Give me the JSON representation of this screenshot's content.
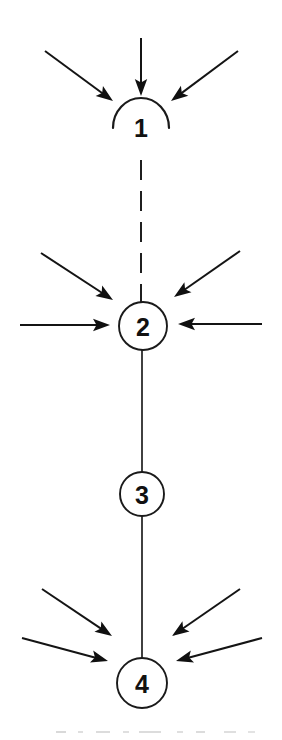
{
  "diagram": {
    "kind": "node-chain-diagram",
    "background_color": "#ffffff",
    "ink_color": "#1a1a1a",
    "canvas": {
      "width": 282,
      "height": 740
    },
    "nodes": [
      {
        "id": "node-1",
        "label": "1",
        "shape": "semicircle-open-bottom",
        "cx": 141,
        "cy": 124,
        "r": 28,
        "incoming_arrow_count": 3
      },
      {
        "id": "node-2",
        "label": "2",
        "shape": "circle",
        "cx": 143,
        "cy": 326,
        "r": 24,
        "incoming_arrow_count": 4
      },
      {
        "id": "node-3",
        "label": "3",
        "shape": "circle",
        "cx": 142,
        "cy": 494,
        "r": 22,
        "incoming_arrow_count": 0
      },
      {
        "id": "node-4",
        "label": "4",
        "shape": "circle",
        "cx": 142,
        "cy": 683,
        "r": 25,
        "incoming_arrow_count": 4
      }
    ],
    "links": [
      {
        "id": "link-1-2",
        "from": "node-1",
        "to": "node-2",
        "style": "dashed",
        "x1": 141,
        "y1": 160,
        "x2": 141,
        "y2": 302
      },
      {
        "id": "link-2-3",
        "from": "node-2",
        "to": "node-3",
        "style": "solid",
        "x1": 142,
        "y1": 350,
        "x2": 142,
        "y2": 472
      },
      {
        "id": "link-3-4",
        "from": "node-3",
        "to": "node-4",
        "style": "solid",
        "x1": 142,
        "y1": 516,
        "x2": 142,
        "y2": 658
      }
    ],
    "arrows": [
      {
        "id": "arrow-n1-left",
        "target": "node-1",
        "x1": 45,
        "y1": 51,
        "x2": 113,
        "y2": 101
      },
      {
        "id": "arrow-n1-top",
        "target": "node-1",
        "x1": 141,
        "y1": 38,
        "x2": 141,
        "y2": 96
      },
      {
        "id": "arrow-n1-right",
        "target": "node-1",
        "x1": 238,
        "y1": 51,
        "x2": 171,
        "y2": 101
      },
      {
        "id": "arrow-n2-upper-left",
        "target": "node-2",
        "x1": 41,
        "y1": 253,
        "x2": 113,
        "y2": 300
      },
      {
        "id": "arrow-n2-left",
        "target": "node-2",
        "x1": 20,
        "y1": 325,
        "x2": 110,
        "y2": 325
      },
      {
        "id": "arrow-n2-upper-right",
        "target": "node-2",
        "x1": 240,
        "y1": 251,
        "x2": 174,
        "y2": 297
      },
      {
        "id": "arrow-n2-right",
        "target": "node-2",
        "x1": 262,
        "y1": 324,
        "x2": 178,
        "y2": 324
      },
      {
        "id": "arrow-n4-upper-left",
        "target": "node-4",
        "x1": 42,
        "y1": 589,
        "x2": 112,
        "y2": 636
      },
      {
        "id": "arrow-n4-lower-left",
        "target": "node-4",
        "x1": 22,
        "y1": 638,
        "x2": 108,
        "y2": 661
      },
      {
        "id": "arrow-n4-upper-right",
        "target": "node-4",
        "x1": 240,
        "y1": 589,
        "x2": 172,
        "y2": 636
      },
      {
        "id": "arrow-n4-lower-right",
        "target": "node-4",
        "x1": 262,
        "y1": 638,
        "x2": 176,
        "y2": 661
      }
    ]
  }
}
